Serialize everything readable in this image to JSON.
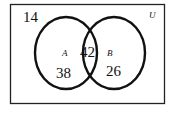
{
  "diagram": {
    "type": "venn",
    "universe_label": "U",
    "sets": [
      {
        "name": "A",
        "only_count": "38"
      },
      {
        "name": "B",
        "only_count": "26"
      }
    ],
    "intersection_count": "42",
    "outside_count": "14"
  }
}
